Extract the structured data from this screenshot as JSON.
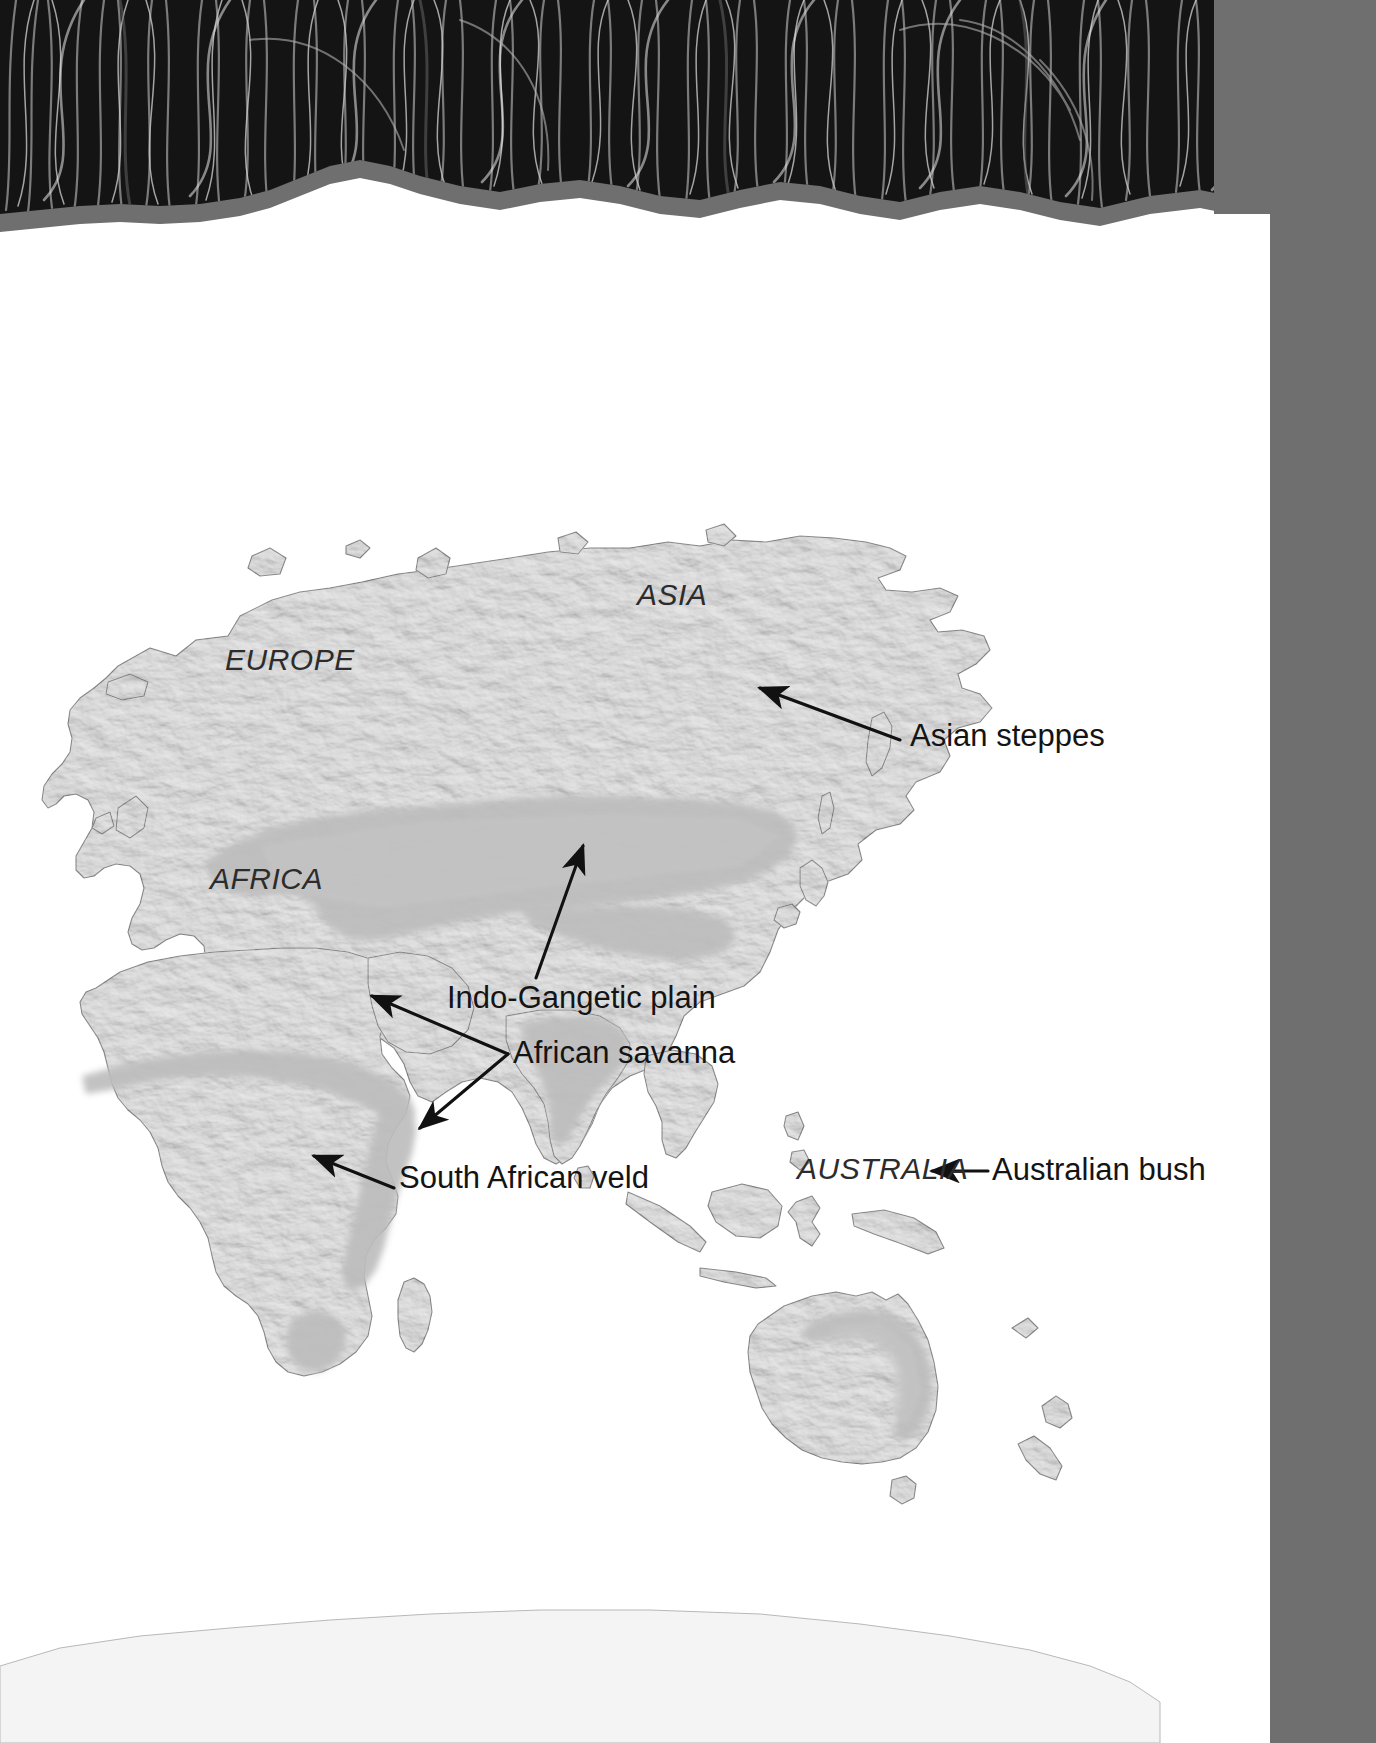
{
  "page": {
    "background_color": "#ffffff",
    "tab_strip_color": "#6f6f6f",
    "photo_banner": {
      "name": "tall-grass-photograph",
      "description": "Black and white photograph of dense tall grass stems",
      "height_px": 232,
      "torn_edge": true
    }
  },
  "map": {
    "projection_note": "Eastern hemisphere world map, shaded relief",
    "land_color": "#e6e6e6",
    "land_outline_color": "#8c8c8c",
    "ocean_color": "#ffffff",
    "grassland_shade_color": "#bdbdbd",
    "continent_labels": [
      {
        "id": "europe",
        "text": "EUROPE",
        "x": 225,
        "y": 643
      },
      {
        "id": "asia",
        "text": "ASIA",
        "x": 637,
        "y": 578
      },
      {
        "id": "africa",
        "text": "AFRICA",
        "x": 210,
        "y": 862
      },
      {
        "id": "australia",
        "text": "AUSTRALIA",
        "x": 797,
        "y": 1152
      }
    ],
    "callouts": [
      {
        "id": "asian-steppes",
        "text": "Asian steppes",
        "label_x": 910,
        "label_y": 718,
        "arrow_from": {
          "x": 900,
          "y": 740
        },
        "arrow_to": {
          "x": 757,
          "y": 686
        },
        "double_pointer": false
      },
      {
        "id": "indo-gangetic-plain",
        "text": "Indo-Gangetic plain",
        "label_x": 447,
        "label_y": 980,
        "arrow_from": {
          "x": 533,
          "y": 975
        },
        "arrow_to": {
          "x": 580,
          "y": 843
        },
        "double_pointer": false
      },
      {
        "id": "african-savanna",
        "text": "African savanna",
        "label_x": 513,
        "label_y": 1035,
        "arrow_from": {
          "x": 505,
          "y": 1053
        },
        "arrow_to": {
          "x": 370,
          "y": 993
        },
        "arrow_to_2": {
          "x": 419,
          "y": 1128
        },
        "double_pointer": true
      },
      {
        "id": "south-african-veld",
        "text": "South African veld",
        "label_x": 399,
        "label_y": 1160,
        "arrow_from": {
          "x": 392,
          "y": 1187
        },
        "arrow_to": {
          "x": 314,
          "y": 1156
        },
        "double_pointer": false
      },
      {
        "id": "australian-bush",
        "text": "Australian bush",
        "label_x": 992,
        "label_y": 1152,
        "arrow_from": {
          "x": 985,
          "y": 1170
        },
        "arrow_to": {
          "x": 930,
          "y": 1170
        },
        "double_pointer": false
      }
    ],
    "grassland_regions": [
      {
        "id": "asian-steppe-belt",
        "name": "Asian steppes",
        "continent": "Asia"
      },
      {
        "id": "indo-gangetic-belt",
        "name": "Indo-Gangetic plain",
        "continent": "Asia"
      },
      {
        "id": "sahel-savanna-belt",
        "name": "African savanna",
        "continent": "Africa"
      },
      {
        "id": "east-african-belt",
        "name": "African savanna",
        "continent": "Africa"
      },
      {
        "id": "south-africa-veld",
        "name": "South African veld",
        "continent": "Africa"
      },
      {
        "id": "australian-bush",
        "name": "Australian bush",
        "continent": "Australia"
      }
    ]
  }
}
